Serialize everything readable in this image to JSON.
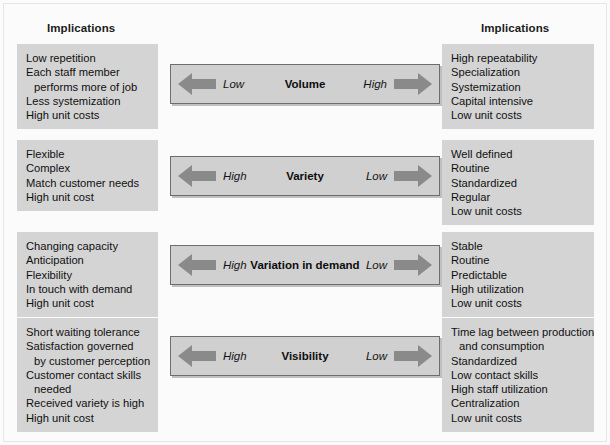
{
  "figure": {
    "background_color": "#fbfbfb",
    "box_color": "#d4d4d4",
    "bar_color": "#d0d0d0",
    "arrow_color": "#8a8a8a",
    "border_color": "#6d6d6d"
  },
  "headings": {
    "left": "Implications",
    "right": "Implications"
  },
  "rows": [
    {
      "dimension": {
        "label": "Volume",
        "left_pole": "Low",
        "right_pole": "High",
        "left_arrow_icon": "arrow-left-icon",
        "right_arrow_icon": "arrow-right-icon"
      },
      "left_implications": [
        {
          "text": "Low repetition",
          "indent": false
        },
        {
          "text": "Each staff member",
          "indent": false
        },
        {
          "text": "performs more of job",
          "indent": true
        },
        {
          "text": "Less systemization",
          "indent": false
        },
        {
          "text": "High unit costs",
          "indent": false
        }
      ],
      "right_implications": [
        {
          "text": "High repeatability",
          "indent": false
        },
        {
          "text": "Specialization",
          "indent": false
        },
        {
          "text": "Systemization",
          "indent": false
        },
        {
          "text": "Capital intensive",
          "indent": false
        },
        {
          "text": "Low unit costs",
          "indent": false
        }
      ]
    },
    {
      "dimension": {
        "label": "Variety",
        "left_pole": "High",
        "right_pole": "Low",
        "left_arrow_icon": "arrow-left-icon",
        "right_arrow_icon": "arrow-right-icon"
      },
      "left_implications": [
        {
          "text": "Flexible",
          "indent": false
        },
        {
          "text": "Complex",
          "indent": false
        },
        {
          "text": "Match customer needs",
          "indent": false
        },
        {
          "text": "High unit cost",
          "indent": false
        }
      ],
      "right_implications": [
        {
          "text": "Well defined",
          "indent": false
        },
        {
          "text": "Routine",
          "indent": false
        },
        {
          "text": "Standardized",
          "indent": false
        },
        {
          "text": "Regular",
          "indent": false
        },
        {
          "text": "Low unit costs",
          "indent": false
        }
      ]
    },
    {
      "dimension": {
        "label": "Variation in demand",
        "left_pole": "High",
        "right_pole": "Low",
        "left_arrow_icon": "arrow-left-icon",
        "right_arrow_icon": "arrow-right-icon"
      },
      "left_implications": [
        {
          "text": "Changing capacity",
          "indent": false
        },
        {
          "text": "Anticipation",
          "indent": false
        },
        {
          "text": "Flexibility",
          "indent": false
        },
        {
          "text": "In touch with demand",
          "indent": false
        },
        {
          "text": "High unit cost",
          "indent": false
        }
      ],
      "right_implications": [
        {
          "text": "Stable",
          "indent": false
        },
        {
          "text": "Routine",
          "indent": false
        },
        {
          "text": "Predictable",
          "indent": false
        },
        {
          "text": "High utilization",
          "indent": false
        },
        {
          "text": "Low unit costs",
          "indent": false
        }
      ]
    },
    {
      "dimension": {
        "label": "Visibility",
        "left_pole": "High",
        "right_pole": "Low",
        "left_arrow_icon": "arrow-left-icon",
        "right_arrow_icon": "arrow-right-icon"
      },
      "left_implications": [
        {
          "text": "Short waiting tolerance",
          "indent": false
        },
        {
          "text": "Satisfaction governed",
          "indent": false
        },
        {
          "text": "by customer perception",
          "indent": true
        },
        {
          "text": "Customer contact skills",
          "indent": false
        },
        {
          "text": "needed",
          "indent": true
        },
        {
          "text": "Received variety is high",
          "indent": false
        },
        {
          "text": "High unit cost",
          "indent": false
        }
      ],
      "right_implications": [
        {
          "text": "Time lag between production",
          "indent": false
        },
        {
          "text": "and consumption",
          "indent": true
        },
        {
          "text": "Standardized",
          "indent": false
        },
        {
          "text": "Low contact skills",
          "indent": false
        },
        {
          "text": "High staff utilization",
          "indent": false
        },
        {
          "text": "Centralization",
          "indent": false
        },
        {
          "text": "Low unit costs",
          "indent": false
        }
      ]
    }
  ],
  "geometry": {
    "left_box_tops": [
      44,
      140,
      232,
      318
    ],
    "right_box_tops": [
      44,
      140,
      232,
      318
    ],
    "bar_tops": [
      64,
      156,
      245,
      336
    ]
  }
}
